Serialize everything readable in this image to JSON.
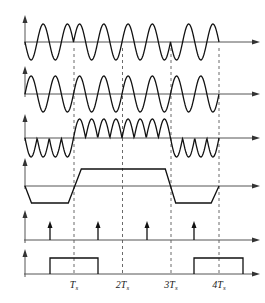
{
  "figure": {
    "panels": [
      {
        "id": "a",
        "label": "a",
        "baseline_y": 42,
        "top_y": 17,
        "origin_label": "O",
        "t_label": "t"
      },
      {
        "id": "b",
        "label": "b",
        "baseline_y": 94,
        "top_y": 68,
        "origin_label": "O",
        "t_label": "t"
      },
      {
        "id": "c",
        "label": "c",
        "baseline_y": 138,
        "top_y": 116,
        "origin_label": "O",
        "t_label": "t"
      },
      {
        "id": "d",
        "label": "d",
        "baseline_y": 186,
        "top_y": 160,
        "origin_label": "O",
        "t_label": "t"
      },
      {
        "id": "e",
        "label": "e",
        "baseline_y": 240,
        "top_y": 212,
        "origin_label": "O",
        "t_label": "t"
      },
      {
        "id": "f",
        "label": "f",
        "baseline_y": 274,
        "top_y": 251,
        "origin_label": "O",
        "t_label": "t"
      }
    ],
    "x_axis": {
      "origin_x": 25,
      "end_x": 254,
      "ts_px": 48.5,
      "tick_labels": [
        {
          "text": "T",
          "sub": "s",
          "x": 74
        },
        {
          "text": "2T",
          "sub": "s",
          "x": 122.5
        },
        {
          "text": "3T",
          "sub": "s",
          "x": 171
        },
        {
          "text": "4T",
          "sub": "s",
          "x": 219
        }
      ]
    },
    "carrier_cycles_per_Ts": 2,
    "amplitudes": {
      "a": 18,
      "b": 18,
      "c": 19
    },
    "bits_sign": [
      -1,
      1,
      1,
      -1
    ],
    "d_levels": {
      "high_y": 169,
      "low_y": 203,
      "ramp_px": 13
    },
    "e_pulses_x": [
      50,
      98,
      147,
      194
    ],
    "e_pulse_top_y": 222,
    "f_pulses": [
      {
        "x1": 50,
        "x2": 98
      },
      {
        "x1": 194,
        "x2": 243
      }
    ],
    "f_high_y": 258,
    "dashed_x": [
      74,
      122.5,
      171,
      219
    ],
    "colors": {
      "line": "#111111",
      "axis": "#555555",
      "dash": "#444444"
    }
  }
}
